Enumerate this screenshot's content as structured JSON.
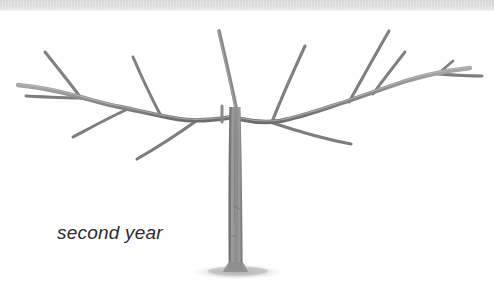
{
  "figure": {
    "caption": "second year",
    "background_color": "#ffffff",
    "top_band_color": "#dcdcdc",
    "branch_color": "#8c8c8c",
    "branch_dark_color": "#6e6e6e",
    "branch_light_color": "#b5b5b5",
    "trunk_color": "#949494",
    "shadow_color": "#bfbfbf",
    "caption_color": "#2b2b2b"
  },
  "tree": {
    "trunk": {
      "label": "central trunk",
      "top_x": 233,
      "top_y": 107,
      "base_x": 236,
      "base_y": 272,
      "width_top": 8,
      "width_base": 11
    },
    "central_leader": {
      "label": "central leader shoot",
      "from_x": 237,
      "from_y": 112,
      "to_x": 218,
      "to_y": 31
    },
    "ground_shadow": {
      "label": "ground shadow ellipse",
      "cx": 238,
      "cy": 272,
      "rx": 46,
      "ry": 7
    },
    "left_arm": {
      "label": "left scaffold branch",
      "points": "232,116 196,121 160,115 120,107 80,97 46,89 18,85",
      "upward_shoots": [
        {
          "label": "left-shoot-1",
          "from_x": 160,
          "from_y": 115,
          "to_x": 132,
          "to_y": 57
        },
        {
          "label": "left-shoot-2",
          "from_x": 80,
          "from_y": 97,
          "to_x": 44,
          "to_y": 52
        }
      ],
      "downward_shoots": [
        {
          "label": "left-lower-1",
          "from_x": 196,
          "from_y": 121,
          "to_x": 136,
          "to_y": 159
        },
        {
          "label": "left-lower-2",
          "from_x": 129,
          "from_y": 108,
          "to_x": 72,
          "to_y": 137
        },
        {
          "label": "left-lower-3",
          "from_x": 80,
          "from_y": 97,
          "to_x": 26,
          "to_y": 96
        }
      ]
    },
    "right_arm": {
      "label": "right scaffold branch",
      "points": "240,118 276,122 312,113 348,101 374,93 410,82 444,72 470,68",
      "upward_shoots": [
        {
          "label": "right-shoot-1",
          "from_x": 272,
          "from_y": 121,
          "to_x": 304,
          "to_y": 46
        },
        {
          "label": "right-shoot-2",
          "from_x": 348,
          "from_y": 101,
          "to_x": 388,
          "to_y": 31
        },
        {
          "label": "right-shoot-3",
          "from_x": 372,
          "from_y": 93,
          "to_x": 404,
          "to_y": 52
        },
        {
          "label": "right-shoot-4",
          "from_x": 438,
          "from_y": 72,
          "to_x": 452,
          "to_y": 62
        }
      ],
      "downward_shoots": [
        {
          "label": "right-lower-1",
          "from_x": 272,
          "from_y": 122,
          "to_x": 350,
          "to_y": 144
        },
        {
          "label": "right-lower-2",
          "from_x": 438,
          "from_y": 73,
          "to_x": 482,
          "to_y": 76
        }
      ]
    }
  }
}
